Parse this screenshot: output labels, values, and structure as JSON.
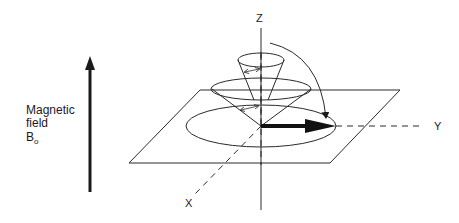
{
  "diagram": {
    "field_label": {
      "line1": "Magnetic",
      "line2": "field",
      "symbol": "B",
      "subscript": "o"
    },
    "axes": {
      "z": "Z",
      "y": "Y",
      "x": "X"
    },
    "elements": [
      "magnetic-field-arrow",
      "xy-plane",
      "precession-cone-small",
      "precession-cone-large",
      "precession-circle-xy",
      "magnetization-vector-xy",
      "flip-arc-arrow"
    ]
  }
}
